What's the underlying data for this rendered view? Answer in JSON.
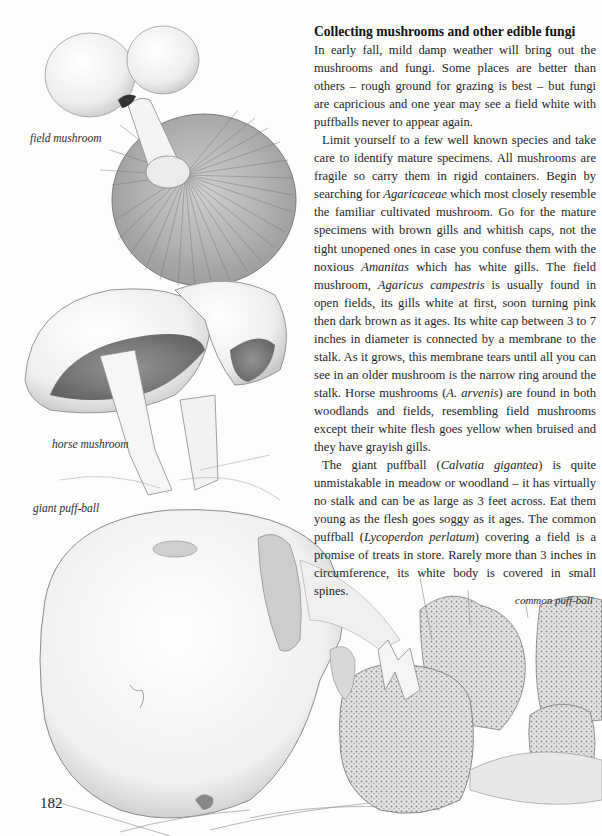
{
  "page": {
    "heading": "Collecting mushrooms and other edible fungi",
    "page_number": "182",
    "paragraphs": [
      [
        {
          "t": "In early fall, mild damp weather will bring out the mushrooms and fungi. Some places are better than others – rough ground for grazing is best – but fungi are capricious and one year may see a field white with puffballs never to appear again."
        }
      ],
      [
        {
          "t": "Limit yourself to a few well known species and take care to identify mature specimens. All mushrooms are fragile so carry them in rigid containers. Begin by searching for "
        },
        {
          "t": "Agaricaceae",
          "i": true
        },
        {
          "t": " which most closely resemble the familiar cultivated mushroom. Go for the mature specimens with brown gills and whitish caps, not the tight unopened ones in case you confuse them with the noxious "
        },
        {
          "t": "Amanitas",
          "i": true
        },
        {
          "t": " which has white gills. The field mushroom, "
        },
        {
          "t": "Agaricus campestris",
          "i": true
        },
        {
          "t": " is usually found in open fields, its gills white at first, soon turning pink then dark brown as it ages. Its white cap between 3 to 7 inches in diameter is connected by a membrane to the stalk. As it grows, this membrane tears until all you can see in an older mushroom is the narrow ring around the stalk. Horse mushrooms ("
        },
        {
          "t": "A. arvenis",
          "i": true
        },
        {
          "t": ") are found in both woodlands and fields, resembling field mushrooms except their white flesh goes yellow when bruised and they have grayish gills."
        }
      ],
      [
        {
          "t": "The giant puffball ("
        },
        {
          "t": "Calvatia gigantea",
          "i": true
        },
        {
          "t": ") is quite unmistakable in meadow or woodland – it has virtually no stalk and can be as large as 3 feet across. Eat them young as the flesh goes soggy as it ages. The common puffball ("
        },
        {
          "t": "Lycoperdon perlatum",
          "i": true
        },
        {
          "t": ") covering a field is a promise of treats in store. Rarely more than 3 inches in circumference, its white body is covered in small spines."
        }
      ]
    ]
  },
  "captions": {
    "field_mushroom": "field mushroom",
    "horse_mushroom": "horse mushroom",
    "giant_puffball": "giant puff-ball",
    "common_puffball": "common puff-ball"
  },
  "colors": {
    "paper": "#fdfdfc",
    "ink": "#1e1e1e",
    "pencil": "#6a6a6a"
  }
}
